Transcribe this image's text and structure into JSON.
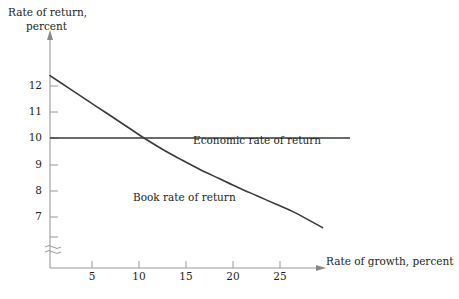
{
  "chart_data": {
    "type": "line",
    "title": "",
    "subtitle": "",
    "xlabel": "Rate of growth, percent",
    "ylabel_line1": "Rate of return,",
    "ylabel_line2": "percent",
    "xlim": [
      0,
      29
    ],
    "ylim": [
      6.2,
      12.8
    ],
    "xticks": [
      5,
      10,
      15,
      20,
      25
    ],
    "yticks": [
      7,
      8,
      9,
      10,
      11,
      12
    ],
    "xtick_labels": [
      "5",
      "10",
      "15",
      "20",
      "25"
    ],
    "ytick_labels": [
      "7",
      "8",
      "9",
      "10",
      "11",
      "12"
    ],
    "grid": false,
    "legend_position": "inline-annotations",
    "y_axis_break": true,
    "y_axis_break_symbol": "≈",
    "axis_arrows": [
      "x-right",
      "y-up"
    ],
    "line_color": "#3a3a3a",
    "axis_color": "#9a9a9a",
    "background_color": "#ffffff",
    "series": [
      {
        "name": "Economic rate of return",
        "label": "Economic rate of return",
        "type": "horizontal-line",
        "constant_value": 10,
        "x": [
          0,
          29
        ],
        "values": [
          10,
          10
        ],
        "label_x": 16.5,
        "label_y": 9.6
      },
      {
        "name": "Book rate of return",
        "label": "Book rate of return",
        "type": "curve",
        "x": [
          0,
          2,
          4,
          6,
          8,
          10,
          12,
          14,
          16,
          18,
          20,
          22,
          24,
          26,
          29
        ],
        "values": [
          12.4,
          11.92,
          11.44,
          10.96,
          10.48,
          10.0,
          9.56,
          9.16,
          8.78,
          8.44,
          8.1,
          7.78,
          7.46,
          7.14,
          6.55
        ],
        "label_x": 9.0,
        "label_y": 7.1
      }
    ],
    "annotations": [
      {
        "text": "Economic rate of return",
        "x": 16.5,
        "y": 9.6
      },
      {
        "text": "Book rate of return",
        "x": 9.0,
        "y": 7.1
      }
    ]
  }
}
